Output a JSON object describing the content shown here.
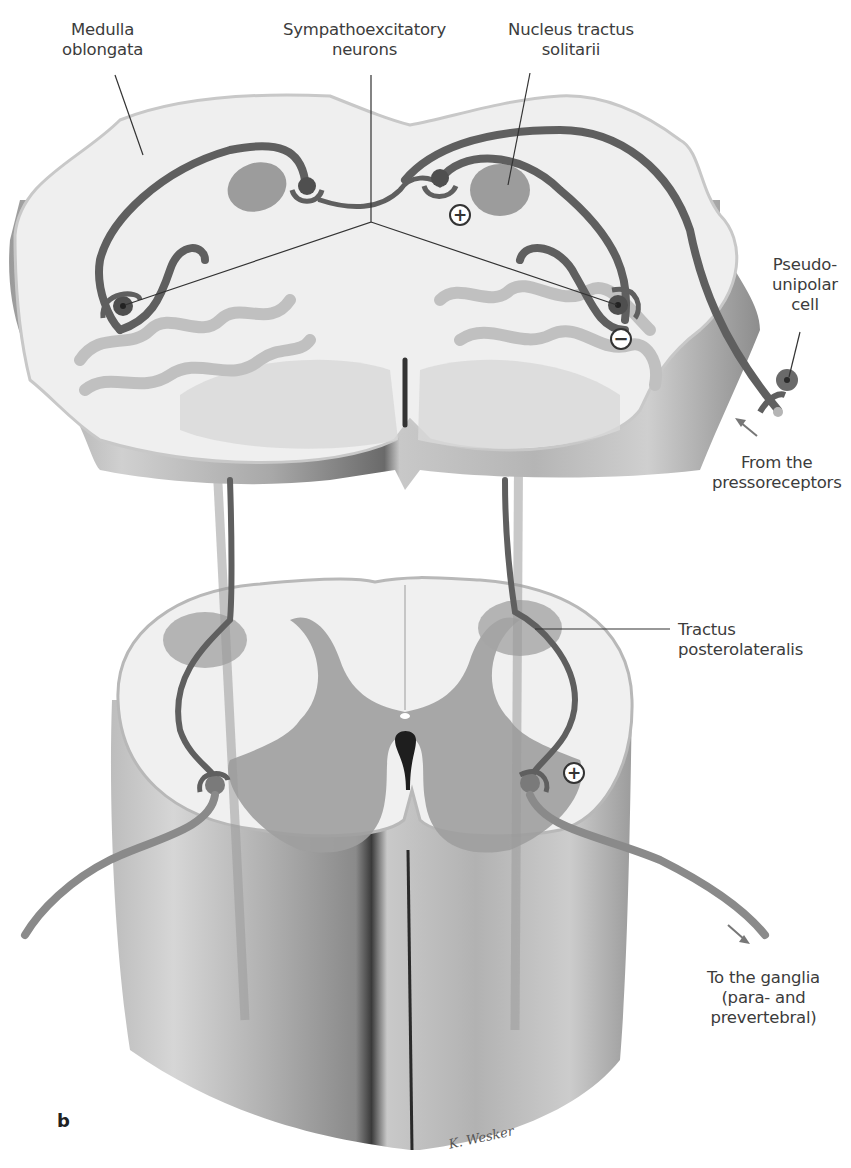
{
  "figure": {
    "panel_letter": "b",
    "signature": "K. Wesker",
    "colors": {
      "background": "#ffffff",
      "tissue_white": "#f1f1f1",
      "tissue_edge": "#bdbdbd",
      "side_wall": "#a9a9a9",
      "gray_matter": "#9e9e9e",
      "nucleus": "#999999",
      "neuron_pathway": "#5f5f5f",
      "efferent_fiber": "#8a8a8a",
      "canal": "#1e1e1e",
      "leader_line": "#333333"
    },
    "labels": {
      "medulla": [
        "Medulla",
        "oblongata"
      ],
      "sympathoexcitatory": [
        "Sympathoexcitatory",
        "neurons"
      ],
      "nts": [
        "Nucleus tractus",
        "solitarii"
      ],
      "pseudounipolar": [
        "Pseudo-",
        "unipolar",
        "cell"
      ],
      "pressoreceptors": [
        "From the",
        "pressoreceptors"
      ],
      "tractus": [
        "Tractus",
        "posterolateralis"
      ],
      "ganglia": [
        "To the ganglia",
        "(para- and",
        "prevertebral)"
      ]
    },
    "signs": {
      "nts_excitatory": "+",
      "medulla_inhibitory": "−",
      "spinal_excitatory": "+"
    }
  }
}
